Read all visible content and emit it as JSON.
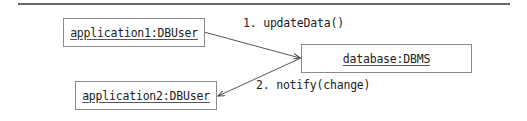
{
  "diagram": {
    "type": "UML collaboration diagram",
    "objects": [
      {
        "id": "app1",
        "label": "application1:DBUser"
      },
      {
        "id": "db",
        "label": "database:DBMS"
      },
      {
        "id": "app2",
        "label": "application2:DBUser"
      }
    ],
    "messages": [
      {
        "from": "app1",
        "to": "db",
        "label": "1. updateData()"
      },
      {
        "from": "db",
        "to": "app2",
        "label": "2. notify(change)"
      }
    ]
  }
}
